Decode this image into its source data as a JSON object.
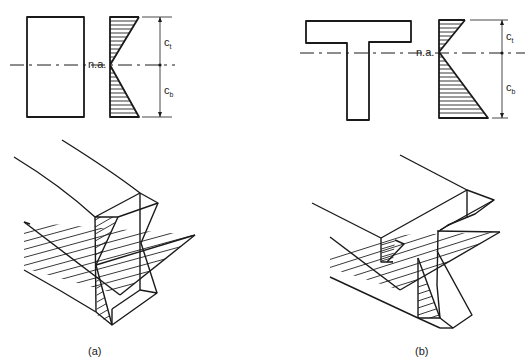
{
  "figure": {
    "panel_a": {
      "caption": "(a)",
      "section_shape": "rectangular",
      "neutral_axis_label": "n.a.",
      "dim_top_label": "c",
      "dim_top_sub": "t",
      "dim_bottom_label": "c",
      "dim_bottom_sub": "b"
    },
    "panel_b": {
      "caption": "(b)",
      "section_shape": "T-section",
      "neutral_axis_label": "n.a.",
      "dim_top_label": "c",
      "dim_top_sub": "t",
      "dim_bottom_label": "c",
      "dim_bottom_sub": "b"
    },
    "colors": {
      "ink": "#1a1a1a",
      "background": "#ffffff"
    }
  }
}
